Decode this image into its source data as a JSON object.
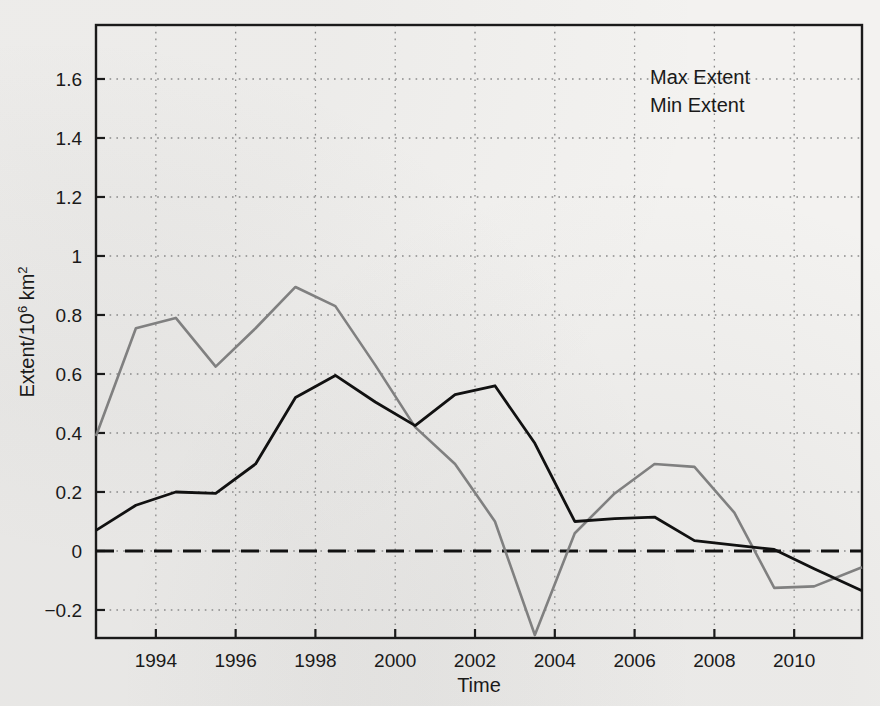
{
  "chart_data": {
    "type": "line",
    "title": "",
    "xlabel": "Time",
    "ylabel": "Extent/10⁶ km²",
    "ylabel_parts": {
      "base": "Extent/10",
      "exponent": "6",
      "unit": " km",
      "unit_exponent": "2"
    },
    "xlim": [
      1992.5,
      2011.7
    ],
    "ylim": [
      -0.295,
      1.783
    ],
    "xticks": [
      1994,
      1996,
      1998,
      2000,
      2002,
      2004,
      2006,
      2008,
      2010
    ],
    "xtick_labels": [
      "1994",
      "1996",
      "1998",
      "2000",
      "2002",
      "2004",
      "2006",
      "2008",
      "2010"
    ],
    "yticks": [
      -0.2,
      0,
      0.2,
      0.4,
      0.6,
      0.8,
      1.0,
      1.2,
      1.4,
      1.6
    ],
    "ytick_labels": [
      "−0.2",
      "0",
      "0.2",
      "0.4",
      "0.6",
      "0.8",
      "1",
      "1.2",
      "1.4",
      "1.6"
    ],
    "grid": "dotted",
    "legend_position": "top-right",
    "reference_line": {
      "y": 0,
      "style": "dashed",
      "color": "#111111"
    },
    "series": [
      {
        "name": "Max Extent",
        "color": "#111111",
        "x": [
          1992.5,
          1993.5,
          1994.5,
          1995.5,
          1996.5,
          1997.5,
          1998.5,
          1999.5,
          2000.5,
          2001.5,
          2002.5,
          2003.5,
          2004.5,
          2005.5,
          2006.5,
          2007.5,
          2008.5,
          2009.5,
          2010.5,
          2011.7
        ],
        "y": [
          0.07,
          0.155,
          0.2,
          0.195,
          0.295,
          0.52,
          0.595,
          0.505,
          0.425,
          0.53,
          0.56,
          0.365,
          0.1,
          0.11,
          0.115,
          0.035,
          0.02,
          0.005,
          -0.06,
          -0.135
        ]
      },
      {
        "name": "Min Extent",
        "color": "#808080",
        "x": [
          1992.5,
          1993.5,
          1994.5,
          1995.5,
          1996.5,
          1997.5,
          1998.5,
          1999.5,
          2000.5,
          2001.5,
          2002.5,
          2003.5,
          2004.5,
          2005.5,
          2006.5,
          2007.5,
          2008.5,
          2009.5,
          2010.5,
          2011.7
        ],
        "y": [
          0.39,
          0.755,
          0.79,
          0.625,
          0.755,
          0.895,
          0.83,
          0.63,
          0.42,
          0.295,
          0.1,
          -0.285,
          0.06,
          0.195,
          0.295,
          0.285,
          0.13,
          -0.125,
          -0.12,
          -0.055
        ]
      }
    ]
  },
  "legend": {
    "items": [
      {
        "label": "Max Extent",
        "color": "#111111"
      },
      {
        "label": "Min Extent",
        "color": "#808080"
      }
    ]
  }
}
